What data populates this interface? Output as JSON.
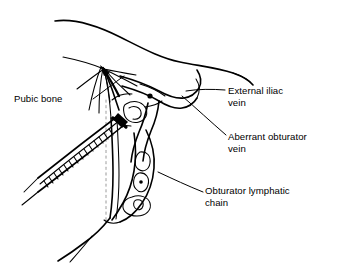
{
  "figure": {
    "type": "anatomical-line-drawing",
    "background_color": "#ffffff",
    "ink_color": "#000000",
    "width": 347,
    "height": 274
  },
  "labels": [
    {
      "id": "pubic-bone",
      "text": "Pubic bone",
      "position": "left",
      "leader": "points up-right to the pubic bone fan of fibers"
    },
    {
      "id": "external-iliac-vein",
      "text": "External iliac\nvein",
      "position": "right-top",
      "leader": "points left to the large vessel crossing the field"
    },
    {
      "id": "aberrant-obturator-vein",
      "text": "Aberrant obturator\nvein",
      "position": "right-middle",
      "leader": "points up-left to the anomalous venous branch"
    },
    {
      "id": "obturator-lymphatic-chain",
      "text": "Obturator lymphatic\nchain",
      "position": "right-bottom",
      "leader": "points up-left to the chain of nodes"
    }
  ],
  "structures": [
    {
      "name": "pubic-bone",
      "description": "converging fan of fibrous lines at upper left of the operative field"
    },
    {
      "name": "external-iliac-vein",
      "description": "broad tubular vessel running from upper centre toward the right"
    },
    {
      "name": "aberrant-obturator-vein",
      "description": "looping vessel branching inferiorly from the external iliac vein"
    },
    {
      "name": "obturator-lymphatic-chain",
      "description": "vertical chain of oval lymph nodes descending in the obturator fossa"
    },
    {
      "name": "surgical-instrument",
      "description": "hatched clip applier / forceps entering from lower left toward the vein"
    },
    {
      "name": "tissue-contour",
      "description": "sweeping outer contour of the soft tissue at the top of the field"
    }
  ]
}
